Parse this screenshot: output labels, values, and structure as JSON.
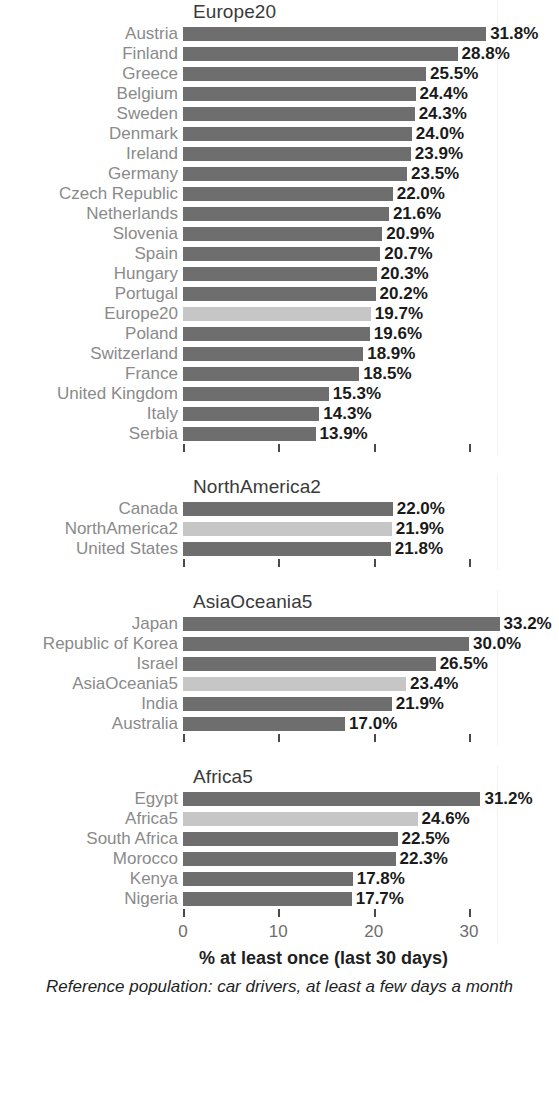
{
  "chart_data": {
    "type": "bar",
    "orientation": "horizontal",
    "title": "",
    "xlabel": "% at least once (last 30 days)",
    "ylabel": "",
    "subcaption": "Reference population: car drivers, at least a few days a month",
    "xlim": [
      0,
      33.8
    ],
    "xticks": [
      0,
      10,
      20,
      30
    ],
    "xticklabels": [
      "0",
      "10",
      "20",
      "30"
    ],
    "grid": false,
    "legend": null,
    "value_suffix": "%",
    "colors": {
      "bar": "#6e6e6e",
      "bar_highlight": "#c6c6c6",
      "label": "#8a8a8a",
      "value": "#1a1a1a",
      "title": "#3a3a3a",
      "tick_label": "#6e6e6e",
      "background": "#ffffff"
    },
    "panels": [
      {
        "name": "Europe20",
        "categories": [
          "Austria",
          "Finland",
          "Greece",
          "Belgium",
          "Sweden",
          "Denmark",
          "Ireland",
          "Germany",
          "Czech Republic",
          "Netherlands",
          "Slovenia",
          "Spain",
          "Hungary",
          "Portugal",
          "Europe20",
          "Poland",
          "Switzerland",
          "France",
          "United Kingdom",
          "Italy",
          "Serbia"
        ],
        "values": [
          31.8,
          28.8,
          25.5,
          24.4,
          24.3,
          24.0,
          23.9,
          23.5,
          22.0,
          21.6,
          20.9,
          20.7,
          20.3,
          20.2,
          19.7,
          19.6,
          18.9,
          18.5,
          15.3,
          14.3,
          13.9
        ],
        "labels": [
          "31.8%",
          "28.8%",
          "25.5%",
          "24.4%",
          "24.3%",
          "24.0%",
          "23.9%",
          "23.5%",
          "22.0%",
          "21.6%",
          "20.9%",
          "20.7%",
          "20.3%",
          "20.2%",
          "19.7%",
          "19.6%",
          "18.9%",
          "18.5%",
          "15.3%",
          "14.3%",
          "13.9%"
        ],
        "highlight_index": 14
      },
      {
        "name": "NorthAmerica2",
        "categories": [
          "Canada",
          "NorthAmerica2",
          "United States"
        ],
        "values": [
          22.0,
          21.9,
          21.8
        ],
        "labels": [
          "22.0%",
          "21.9%",
          "21.8%"
        ],
        "highlight_index": 1
      },
      {
        "name": "AsiaOceania5",
        "categories": [
          "Japan",
          "Republic of Korea",
          "Israel",
          "AsiaOceania5",
          "India",
          "Australia"
        ],
        "values": [
          33.2,
          30.0,
          26.5,
          23.4,
          21.9,
          17.0
        ],
        "labels": [
          "33.2%",
          "30.0%",
          "26.5%",
          "23.4%",
          "21.9%",
          "17.0%"
        ],
        "highlight_index": 3
      },
      {
        "name": "Africa5",
        "categories": [
          "Egypt",
          "Africa5",
          "South Africa",
          "Morocco",
          "Kenya",
          "Nigeria"
        ],
        "values": [
          31.2,
          24.6,
          22.5,
          22.3,
          17.8,
          17.7
        ],
        "labels": [
          "31.2%",
          "24.6%",
          "22.5%",
          "22.3%",
          "17.8%",
          "17.7%"
        ],
        "highlight_index": 1
      }
    ]
  },
  "figure": {
    "xlabel": "% at least once (last 30 days)",
    "subcaption": "Reference population: car drivers, at least a few days a month"
  }
}
